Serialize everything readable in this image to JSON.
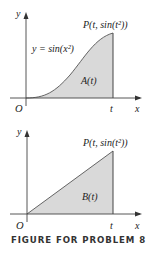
{
  "figure": {
    "caption": "FIGURE FOR PROBLEM 8",
    "colors": {
      "fill": "#d9d9d9",
      "axis": "#444444",
      "curve": "#444444"
    },
    "top_graph": {
      "y_axis_label": "y",
      "x_axis_label": "x",
      "origin_label": "O",
      "t_label": "t",
      "point_label": "P(t, sin(t²))",
      "curve_label": "y = sin(x²)",
      "area_label": "A(t)"
    },
    "bottom_graph": {
      "y_axis_label": "y",
      "x_axis_label": "x",
      "origin_label": "O",
      "t_label": "t",
      "point_label": "P(t, sin(t²))",
      "area_label": "B(t)"
    }
  }
}
